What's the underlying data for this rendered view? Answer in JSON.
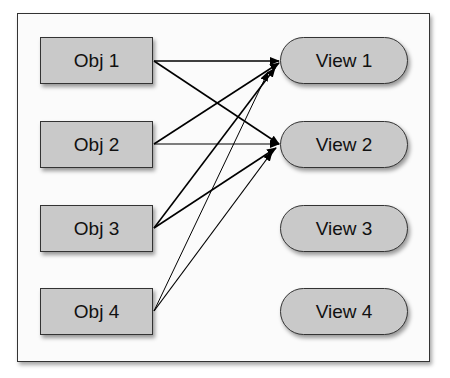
{
  "objects": [
    {
      "label": "Obj 1"
    },
    {
      "label": "Obj 2"
    },
    {
      "label": "Obj 3"
    },
    {
      "label": "Obj 4"
    }
  ],
  "views": [
    {
      "label": "View 1"
    },
    {
      "label": "View 2"
    },
    {
      "label": "View 3"
    },
    {
      "label": "View 4"
    }
  ],
  "connections": [
    {
      "from": "Obj 1",
      "to": "View 1"
    },
    {
      "from": "Obj 1",
      "to": "View 2"
    },
    {
      "from": "Obj 2",
      "to": "View 1"
    },
    {
      "from": "Obj 2",
      "to": "View 2"
    },
    {
      "from": "Obj 3",
      "to": "View 1"
    },
    {
      "from": "Obj 3",
      "to": "View 2"
    },
    {
      "from": "Obj 4",
      "to": "View 1"
    },
    {
      "from": "Obj 4",
      "to": "View 2"
    }
  ],
  "colors": {
    "node_fill": "#c9c9c9",
    "stroke": "#111111",
    "frame": "#333333"
  }
}
